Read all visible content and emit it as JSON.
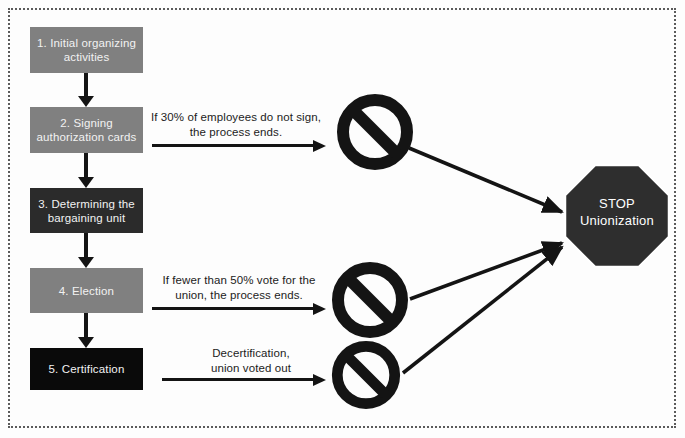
{
  "diagram": {
    "frame_style": "dotted-border",
    "colors": {
      "stage_gray": "#808080",
      "stage_dark": "#2b2b2b",
      "stage_black": "#0a0a0a",
      "arrow": "#141414",
      "text_light": "#f2f2f2",
      "text_dark": "#1c1c1c",
      "background": "#fdfdfd",
      "frame": "#5a5a5a"
    },
    "stages": [
      {
        "id": "stage-1",
        "line1": "1. Initial organizing",
        "line2": "activities",
        "fill": "#808080"
      },
      {
        "id": "stage-2",
        "line1": "2. Signing",
        "line2": "authorization cards",
        "fill": "#808080"
      },
      {
        "id": "stage-3",
        "line1": "3. Determining the",
        "line2": "bargaining unit",
        "fill": "#2b2b2b"
      },
      {
        "id": "stage-4",
        "line1": "4. Election",
        "line2": "",
        "fill": "#808080"
      },
      {
        "id": "stage-5",
        "line1": "5. Certification",
        "line2": "",
        "fill": "#0a0a0a"
      }
    ],
    "exit_branches": [
      {
        "id": "branch-1",
        "from": "stage-2",
        "line1": "If 30% of employees do not sign,",
        "line2": "the process ends."
      },
      {
        "id": "branch-2",
        "from": "stage-4",
        "line1": "If fewer than 50% vote for the",
        "line2": "union, the process ends."
      },
      {
        "id": "branch-3",
        "from": "stage-5",
        "line1": "Decertification,",
        "line2": "union voted out"
      }
    ],
    "prohibition_signs": [
      {
        "id": "no-entry-1",
        "icon": "prohibition-icon"
      },
      {
        "id": "no-entry-2",
        "icon": "prohibition-icon"
      },
      {
        "id": "no-entry-3",
        "icon": "prohibition-icon"
      }
    ],
    "terminator": {
      "id": "stop-unionization",
      "shape": "octagon",
      "line1": "STOP",
      "line2": "Unionization"
    }
  }
}
